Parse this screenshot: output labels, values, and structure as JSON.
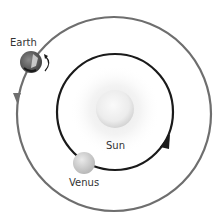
{
  "diagram": {
    "type": "orbital diagram",
    "bodies": [
      {
        "id": "sun",
        "label": "Sun"
      },
      {
        "id": "earth",
        "label": "Earth"
      },
      {
        "id": "venus",
        "label": "Venus"
      }
    ],
    "orbits": [
      {
        "body": "earth",
        "color": "#6e6e6e",
        "direction": "counterclockwise"
      },
      {
        "body": "venus",
        "color": "#1a1a1a",
        "direction": "counterclockwise"
      }
    ],
    "colors": {
      "outer_orbit": "#6e6e6e",
      "inner_orbit": "#1a1a1a",
      "sun": "#eeeeee",
      "venus": "#cfcfcf",
      "earth": "#666666"
    }
  }
}
